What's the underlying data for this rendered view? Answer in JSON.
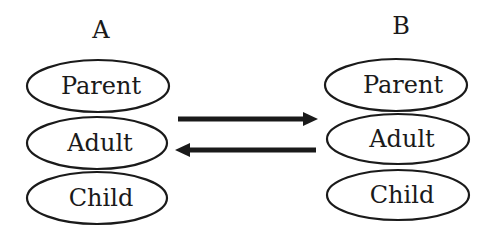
{
  "diagram": {
    "columns": [
      {
        "id": "A",
        "heading": "A",
        "nodes": [
          {
            "label": "Parent"
          },
          {
            "label": "Adult"
          },
          {
            "label": "Child"
          }
        ]
      },
      {
        "id": "B",
        "heading": "B",
        "nodes": [
          {
            "label": "Parent"
          },
          {
            "label": "Adult"
          },
          {
            "label": "Child"
          }
        ]
      }
    ],
    "edges": [
      {
        "from": "A.Adult",
        "to": "B.Adult",
        "direction": "right",
        "icon": "arrow-right-icon"
      },
      {
        "from": "B.Adult",
        "to": "A.Adult",
        "direction": "left",
        "icon": "arrow-left-icon"
      }
    ],
    "colors": {
      "stroke": "#1a1a1a",
      "background": "#ffffff"
    }
  }
}
